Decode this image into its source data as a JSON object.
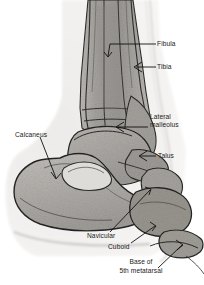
{
  "figure": {
    "width": 204,
    "height": 285,
    "background": "#ffffff",
    "ink_color": "#1a1a1a"
  },
  "labels": {
    "fibula": "Fibula",
    "tibia": "Tibia",
    "lateral_malleolus_line1": "Lateral",
    "lateral_malleolus_line2": "malleolus",
    "talus": "Talus",
    "calcaneus": "Calcaneus",
    "navicular": "Navicular",
    "cuboid": "Cuboid",
    "base_line1": "Base of",
    "base_line2": "5th metatarsal"
  },
  "palette": {
    "bone_light": "#c9c6c2",
    "bone_mid": "#a8a5a1",
    "bone_dark": "#8e8b87",
    "cortex": "#3a3a38",
    "soft_tissue": "#e4e2df",
    "outline": "#2b2b29"
  }
}
